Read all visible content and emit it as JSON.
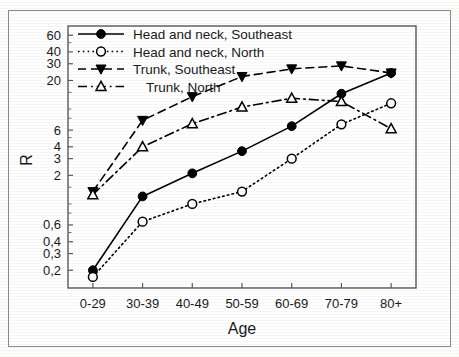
{
  "figure": {
    "axis_title_y": "R",
    "axis_title_x": "Age"
  },
  "chart_data": {
    "type": "line",
    "title": "",
    "xlabel": "Age",
    "ylabel": "R",
    "yscale": "log",
    "ylim": [
      0.13,
      75
    ],
    "grid": false,
    "legend_position": "upper-left-inside",
    "categories": [
      "0-29",
      "30-39",
      "40-49",
      "50-59",
      "60-69",
      "70-79",
      "80+"
    ],
    "ytick_labels": [
      "0,2",
      "0,3",
      "0,4",
      "0,6",
      "2",
      "3",
      "4",
      "6",
      "20",
      "30",
      "40",
      "60"
    ],
    "ytick_values": [
      0.2,
      0.3,
      0.4,
      0.6,
      2,
      3,
      4,
      6,
      20,
      30,
      40,
      60
    ],
    "series": [
      {
        "name": "Head and neck, Southeast",
        "marker": "filled-circle",
        "linestyle": "solid",
        "color": "#000000",
        "values": [
          0.2,
          1.2,
          2.1,
          3.6,
          6.6,
          14.5,
          24.0
        ]
      },
      {
        "name": "Head and neck, North",
        "marker": "open-circle",
        "linestyle": "dotted",
        "color": "#000000",
        "values": [
          0.17,
          0.65,
          1.0,
          1.35,
          3.0,
          6.9,
          11.5
        ]
      },
      {
        "name": "Trunk, Southeast",
        "marker": "filled-triangle-down",
        "linestyle": "dashed",
        "color": "#000000",
        "values": [
          1.35,
          7.6,
          13.5,
          22.0,
          26.5,
          28.5,
          24.0
        ]
      },
      {
        "name": "Trunk, North",
        "marker": "open-triangle-up",
        "linestyle": "dash-dot",
        "color": "#000000",
        "values": [
          1.25,
          4.0,
          7.0,
          10.5,
          13.0,
          12.0,
          6.2
        ]
      }
    ]
  },
  "legend": {
    "items": [
      {
        "label": "Head and neck, Southeast"
      },
      {
        "label": "Head and neck, North"
      },
      {
        "label": "Trunk, Southeast"
      },
      {
        "label": "Trunk, North"
      }
    ]
  }
}
